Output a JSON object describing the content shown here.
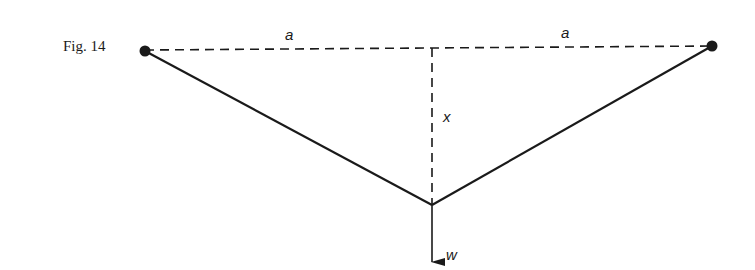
{
  "figure": {
    "caption": "Fig. 14",
    "labels": {
      "left_span": "a",
      "right_span": "a",
      "sag": "x",
      "weight": "w"
    },
    "colors": {
      "ink": "#1a1a1a",
      "background": "#ffffff"
    }
  }
}
